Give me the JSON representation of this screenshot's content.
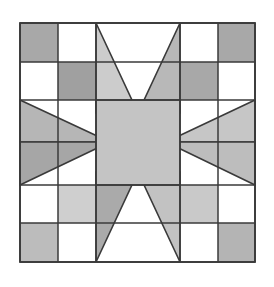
{
  "canvas": {
    "width": 274,
    "height": 287,
    "background": "#ffffff"
  },
  "artwork": {
    "title": "Eight-Pointed Star Quilt Block",
    "type": "quilt-block-diagram",
    "grid_columns": 5,
    "grid_rows": 5,
    "block_bounds": {
      "x": 20,
      "y": 23,
      "width": 235,
      "height": 239
    }
  },
  "palette": {
    "background": "#ffffff",
    "outline": "#3a3a3a",
    "white_patch": "#ffffff",
    "light_gray": "#c9c9c9",
    "medium_gray": "#b4b4b4",
    "dark_gray": "#a0a0a0",
    "center_gray": "#c4c4c4",
    "shadow_gray": "#9a9a9a"
  },
  "geometry": {
    "x_lines": [
      20,
      58,
      96,
      180,
      218,
      255
    ],
    "y_lines": [
      23,
      62,
      100,
      185,
      223,
      262
    ]
  },
  "patches": [
    {
      "name": "corner-top-left",
      "fill": "#a8a8a8",
      "shape": "square"
    },
    {
      "name": "checker-top-left-inner",
      "fill": "#a0a0a0",
      "shape": "square"
    },
    {
      "name": "corner-top-right",
      "fill": "#a8a8a8",
      "shape": "square"
    },
    {
      "name": "checker-top-right-inner",
      "fill": "#a8a8a8",
      "shape": "square"
    },
    {
      "name": "corner-bottom-left",
      "fill": "#bcbcbc",
      "shape": "square"
    },
    {
      "name": "checker-bottom-left-inner",
      "fill": "#cfcfcf",
      "shape": "square"
    },
    {
      "name": "corner-bottom-right",
      "fill": "#b4b4b4",
      "shape": "square"
    },
    {
      "name": "checker-bottom-right-inner",
      "fill": "#c9c9c9",
      "shape": "square"
    },
    {
      "name": "star-center",
      "fill": "#c4c4c4",
      "shape": "square"
    },
    {
      "name": "star-point-north-left",
      "fill": "#cccccc",
      "shape": "triangle"
    },
    {
      "name": "star-point-north-right",
      "fill": "#b8b8b8",
      "shape": "triangle"
    },
    {
      "name": "star-point-south-left",
      "fill": "#aaaaaa",
      "shape": "triangle"
    },
    {
      "name": "star-point-south-right",
      "fill": "#c2c2c2",
      "shape": "triangle"
    },
    {
      "name": "star-point-west-upper",
      "fill": "#b6b6b6",
      "shape": "triangle"
    },
    {
      "name": "star-point-west-lower",
      "fill": "#a6a6a6",
      "shape": "triangle"
    },
    {
      "name": "star-point-east-upper",
      "fill": "#c6c6c6",
      "shape": "triangle"
    },
    {
      "name": "star-point-east-lower",
      "fill": "#bdbdbd",
      "shape": "triangle"
    }
  ]
}
